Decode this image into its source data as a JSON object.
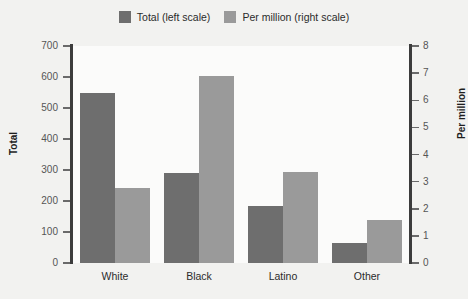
{
  "chart_data": {
    "type": "bar",
    "title": "",
    "subtitle": "",
    "xlabel": "",
    "categories": [
      "White",
      "Black",
      "Latino",
      "Other"
    ],
    "series": [
      {
        "name": "Total (left scale)",
        "axis": "left",
        "color": "#6e6e6e",
        "values": [
          550,
          290,
          185,
          65
        ]
      },
      {
        "name": "Per million (right scale)",
        "axis": "right",
        "color": "#9a9a9a",
        "values": [
          2.75,
          6.9,
          3.35,
          1.6
        ]
      }
    ],
    "left_axis": {
      "label": "Total",
      "ylim": [
        0,
        700
      ],
      "ticks": [
        0,
        100,
        200,
        300,
        400,
        500,
        600,
        700
      ],
      "tick_labels": [
        "0",
        "100",
        "200",
        "300",
        "400",
        "500",
        "600",
        "700"
      ]
    },
    "right_axis": {
      "label": "Per million",
      "ylim": [
        0,
        8
      ],
      "ticks": [
        0,
        1,
        2,
        3,
        4,
        5,
        6,
        7,
        8
      ],
      "tick_labels": [
        "0",
        "1",
        "2",
        "3",
        "4",
        "5",
        "6",
        "7",
        "8"
      ]
    },
    "grid": false,
    "legend_position": "top-center",
    "background_color": "#f2f2f0",
    "plot_background_color": "#fbfbfa",
    "axis_color": "#3c3c3c"
  },
  "legend": {
    "entries": [
      {
        "label": "Total (left scale)",
        "color": "#6e6e6e"
      },
      {
        "label": "Per million (right scale)",
        "color": "#9a9a9a"
      }
    ]
  }
}
